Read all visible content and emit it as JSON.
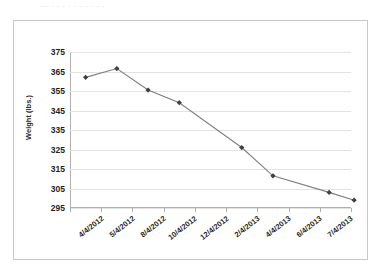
{
  "page": {
    "bleed_text": "…  .  .  .  .  .  .  .  .  .  ."
  },
  "chart": {
    "y_axis_title": "Weight (lbs.)"
  },
  "chart_data": {
    "type": "line",
    "title": "",
    "subtitle": "",
    "xlabel": "",
    "ylabel": "Weight (lbs.)",
    "categories": [
      "4/4/2012",
      "5/4/2012",
      "8/4/2012",
      "10/4/2012",
      "12/4/2012",
      "2/4/2013",
      "4/4/2013",
      "6/4/2013",
      "7/4/2013"
    ],
    "values": [
      362,
      366.5,
      355.5,
      349,
      326,
      311.5,
      null,
      303,
      299
    ],
    "points": [
      {
        "x": "4/4/2012",
        "y": 362
      },
      {
        "x": "5/4/2012",
        "y": 366.5
      },
      {
        "x": "8/4/2012",
        "y": 355.5
      },
      {
        "x": "10/4/2012",
        "y": 349
      },
      {
        "x": "12/4/2012",
        "y": 326
      },
      {
        "x": "2/4/2013",
        "y": 311.5
      },
      {
        "x": "6/4/2013",
        "y": 303
      },
      {
        "x": "7/4/2013",
        "y": 299
      }
    ],
    "point_category_index": [
      0,
      1,
      2,
      3,
      5,
      6,
      7.8,
      8.6
    ],
    "ylim": [
      295,
      375
    ],
    "yticks": [
      295,
      305,
      315,
      325,
      335,
      345,
      355,
      365,
      375
    ],
    "ytick_labels": [
      "295",
      "305",
      "315",
      "325",
      "335",
      "345",
      "355",
      "365",
      "375"
    ],
    "grid": true,
    "grid_axis": "y",
    "legend": false,
    "legend_position": "none",
    "series_color": "#595959",
    "marker": "diamond",
    "marker_color": "#404040",
    "line_color": "#7f7f7f",
    "grid_color": "#e3e3e3",
    "axis_color": "#b0b0b0",
    "border_color": "#c8c8c8",
    "background": "#ffffff"
  }
}
